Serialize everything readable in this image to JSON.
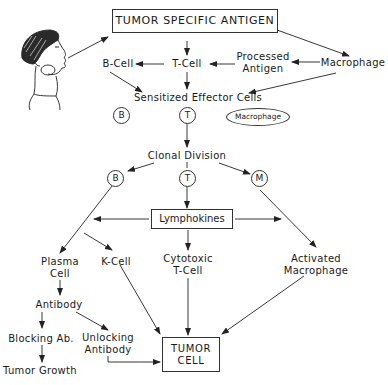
{
  "diagram": {
    "title": "TUMOR SPECIFIC ANTIGEN",
    "nodes": {
      "b_cell_top": "B-Cell",
      "t_cell_top": "T-Cell",
      "processed_antigen_1": "Processed",
      "processed_antigen_2": "Antigen",
      "macrophage_top": "Macrophage",
      "sensitized": "Sensitized  Effector Cells",
      "circle_b1": "B",
      "circle_t1": "T",
      "macrophage_ellipse": "Macrophage",
      "clonal_division": "Clonal Division",
      "circle_b2": "B",
      "circle_t2": "T",
      "circle_m": "M",
      "lymphokines": "Lymphokines",
      "plasma_cell_1": "Plasma",
      "plasma_cell_2": "Cell",
      "k_cell": "K-Cell",
      "cytotoxic_1": "Cytotoxic",
      "cytotoxic_2": "T-Cell",
      "activated_1": "Activated",
      "activated_2": "Macrophage",
      "antibody": "Antibody",
      "blocking_ab": "Blocking Ab.",
      "unlocking_1": "Unlocking",
      "unlocking_2": "Antibody",
      "tumor_growth": "Tumor Growth",
      "tumor_cell_1": "TUMOR",
      "tumor_cell_2": "CELL"
    },
    "illustration": "child-with-neck-tumor",
    "edges": [
      [
        "child",
        "TUMOR SPECIFIC ANTIGEN"
      ],
      [
        "TUMOR SPECIFIC ANTIGEN",
        "T-Cell"
      ],
      [
        "TUMOR SPECIFIC ANTIGEN",
        "Macrophage"
      ],
      [
        "T-Cell",
        "B-Cell"
      ],
      [
        "Processed Antigen",
        "T-Cell"
      ],
      [
        "Macrophage",
        "Processed Antigen"
      ],
      [
        "B-Cell",
        "Sensitized Effector Cells"
      ],
      [
        "T-Cell",
        "Sensitized Effector Cells"
      ],
      [
        "Macrophage",
        "Sensitized Effector Cells"
      ],
      [
        "T",
        "Clonal Division"
      ],
      [
        "Clonal Division",
        "B"
      ],
      [
        "Clonal Division",
        "M"
      ],
      [
        "T",
        "Lymphokines"
      ],
      [
        "Lymphokines",
        "B-branch"
      ],
      [
        "Lymphokines",
        "M-branch"
      ],
      [
        "B",
        "Plasma Cell"
      ],
      [
        "B",
        "K-Cell"
      ],
      [
        "Lymphokines",
        "Cytotoxic T-Cell"
      ],
      [
        "M",
        "Activated Macrophage"
      ],
      [
        "Plasma Cell",
        "Antibody"
      ],
      [
        "Antibody",
        "Blocking Ab."
      ],
      [
        "Antibody",
        "Unlocking Antibody"
      ],
      [
        "Blocking Ab.",
        "Tumor Growth"
      ],
      [
        "Unlocking Antibody",
        "TUMOR CELL"
      ],
      [
        "K-Cell",
        "TUMOR CELL"
      ],
      [
        "Cytotoxic T-Cell",
        "TUMOR CELL"
      ],
      [
        "Activated Macrophage",
        "TUMOR CELL"
      ]
    ]
  }
}
